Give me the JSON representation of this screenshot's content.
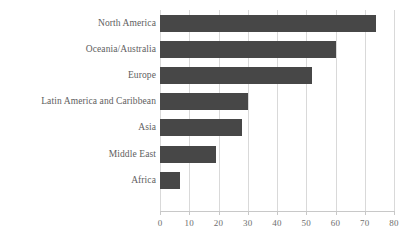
{
  "chart_data": {
    "type": "bar",
    "orientation": "horizontal",
    "title": "",
    "xlabel": "",
    "ylabel": "",
    "categories": [
      "North America",
      "Oceania/Australia",
      "Europe",
      "Latin America and Caribbean",
      "Asia",
      "Middle East",
      "Africa"
    ],
    "values": [
      74,
      60,
      52,
      30,
      28,
      19,
      7
    ],
    "xlim": [
      0,
      80
    ],
    "xticks": [
      0,
      10,
      20,
      30,
      40,
      50,
      60,
      70,
      80
    ],
    "xtick_labels": [
      "0",
      "10",
      "20",
      "30",
      "40",
      "50",
      "60",
      "70",
      "80"
    ],
    "grid": "vertical",
    "legend": "none",
    "bar_color": "#474747",
    "gridline_color": "#d9d9d9",
    "axis_color": "#c8c8c8",
    "label_color": "#5e5e5e",
    "tick_label_color": "#6e6e6e",
    "background_color": "#ffffff"
  }
}
